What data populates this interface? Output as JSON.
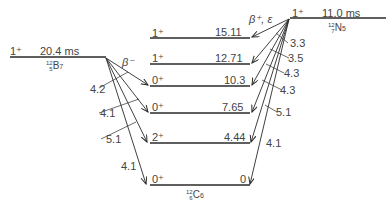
{
  "diagram": {
    "type": "nuclear-energy-level-decay-scheme",
    "parents": {
      "boron": {
        "spin_parity": "1⁺",
        "half_life": "20.4 ms",
        "nuclide": {
          "A": "12",
          "Z": "5",
          "symbol": "B",
          "N": "7"
        },
        "decay_mode": "β⁻"
      },
      "nitrogen": {
        "spin_parity": "1⁺",
        "half_life": "11.0 ms",
        "nuclide": {
          "A": "12",
          "Z": "7",
          "symbol": "N",
          "N": "5"
        },
        "decay_mode": "β⁺, ε"
      }
    },
    "daughter": {
      "nuclide": {
        "A": "12",
        "Z": "6",
        "symbol": "C",
        "N": "6"
      },
      "levels": [
        {
          "spin_parity": "1⁺",
          "energy": "15.11"
        },
        {
          "spin_parity": "1⁺",
          "energy": "12.71"
        },
        {
          "spin_parity": "0⁺",
          "energy": "10.3"
        },
        {
          "spin_parity": "0⁺",
          "energy": "7.65"
        },
        {
          "spin_parity": "2⁺",
          "energy": "4.44"
        },
        {
          "spin_parity": "0⁺",
          "energy": "0"
        }
      ]
    },
    "beta_minus_log_ft": [
      "4.2",
      "4.1",
      "5.1",
      "4.1"
    ],
    "beta_plus_log_ft": [
      "3.3",
      "3.5",
      "4.3",
      "4.3",
      "5.1",
      "4.1"
    ]
  },
  "colors": {
    "line": "#2a2a2a",
    "text": "#444444",
    "background": "#ffffff"
  }
}
